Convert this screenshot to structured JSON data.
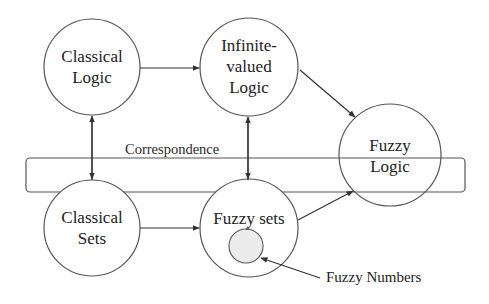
{
  "diagram": {
    "type": "concept-relationship",
    "nodes": [
      {
        "id": "classical_logic",
        "lines": [
          "Classical",
          "Logic"
        ]
      },
      {
        "id": "infinite_valued_logic",
        "lines": [
          "Infinite-",
          "valued",
          "Logic"
        ]
      },
      {
        "id": "fuzzy_logic",
        "lines": [
          "Fuzzy",
          "Logic"
        ]
      },
      {
        "id": "classical_sets",
        "lines": [
          "Classical",
          "Sets"
        ]
      },
      {
        "id": "fuzzy_sets",
        "lines": [
          "Fuzzy sets"
        ]
      },
      {
        "id": "fuzzy_numbers",
        "lines": [
          "Fuzzy Numbers"
        ],
        "shape": "small shaded circle inside Fuzzy sets"
      }
    ],
    "band": {
      "label": "Correspondence"
    },
    "edges": [
      {
        "from": "classical_logic",
        "to": "infinite_valued_logic",
        "direction": "forward"
      },
      {
        "from": "infinite_valued_logic",
        "to": "fuzzy_logic",
        "direction": "forward"
      },
      {
        "from": "classical_sets",
        "to": "fuzzy_sets",
        "direction": "forward"
      },
      {
        "from": "fuzzy_sets",
        "to": "fuzzy_logic",
        "direction": "forward"
      },
      {
        "from": "classical_logic",
        "to": "classical_sets",
        "direction": "bidirectional",
        "label": "Correspondence"
      },
      {
        "from": "infinite_valued_logic",
        "to": "fuzzy_sets",
        "direction": "bidirectional",
        "label": "Correspondence"
      },
      {
        "from": "fuzzy_numbers_label",
        "to": "fuzzy_numbers",
        "direction": "forward"
      }
    ],
    "colors": {
      "stroke": "#555555",
      "text": "#222222",
      "inner_fill": "#ececec",
      "background": "#ffffff"
    }
  }
}
